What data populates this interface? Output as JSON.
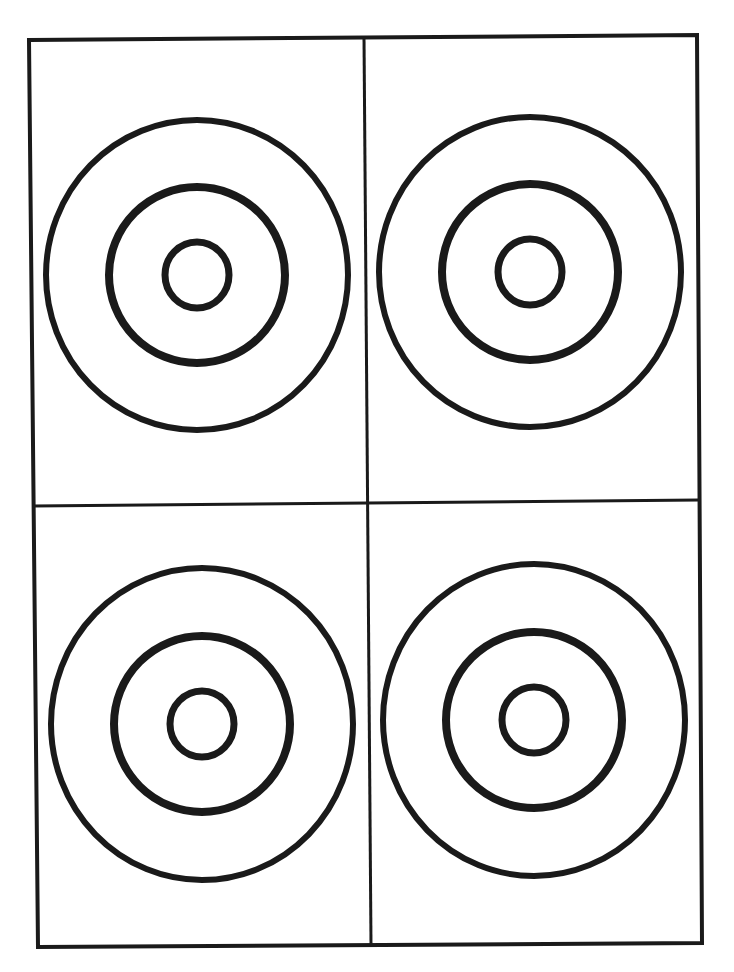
{
  "colors": {
    "ink": "#1a1a1a",
    "paper": "#ffffff"
  },
  "layout": {
    "rows": 2,
    "columns": 2
  },
  "targets": [
    {
      "id": "top-left",
      "row": 1,
      "column": 1,
      "rings": [
        "outer",
        "middle",
        "inner"
      ]
    },
    {
      "id": "top-right",
      "row": 1,
      "column": 2,
      "rings": [
        "outer",
        "middle",
        "inner"
      ]
    },
    {
      "id": "bottom-left",
      "row": 2,
      "column": 1,
      "rings": [
        "outer",
        "middle",
        "inner"
      ]
    },
    {
      "id": "bottom-right",
      "row": 2,
      "column": 2,
      "rings": [
        "outer",
        "middle",
        "inner"
      ]
    }
  ]
}
